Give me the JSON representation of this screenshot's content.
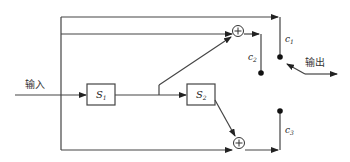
{
  "diagram": {
    "input_label": "输入",
    "output_label": "输出",
    "blocks": [
      {
        "id": "S1",
        "label": "S",
        "subscript": "1"
      },
      {
        "id": "S2",
        "label": "S",
        "subscript": "2"
      }
    ],
    "switch_contacts": [
      {
        "id": "c1",
        "label": "c",
        "subscript": "1"
      },
      {
        "id": "c2",
        "label": "c",
        "subscript": "2"
      },
      {
        "id": "c3",
        "label": "c",
        "subscript": "3"
      }
    ],
    "summing_junctions": [
      {
        "id": "sum-top",
        "symbol": "+"
      },
      {
        "id": "sum-bottom",
        "symbol": "+"
      }
    ],
    "colors": {
      "line": "#444444",
      "background": "#ffffff"
    }
  }
}
